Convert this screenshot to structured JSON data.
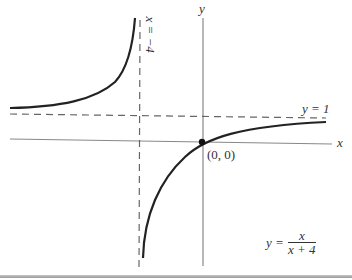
{
  "figure": {
    "axes": {
      "x_label": "x",
      "y_label": "y"
    },
    "asymptotes": {
      "vertical_label": "x = −4",
      "horizontal_label": "y = 1"
    },
    "point": {
      "label": "(0, 0)"
    },
    "equation": {
      "lhs": "y =",
      "numerator": "x",
      "denominator": "x + 4"
    },
    "colors": {
      "curve": "#222222",
      "axes": "#777777",
      "dashed": "#666666"
    }
  }
}
